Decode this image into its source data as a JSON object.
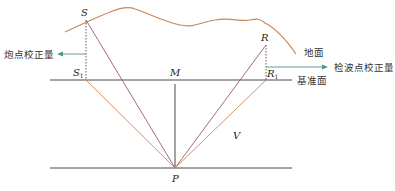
{
  "diagram": {
    "colors": {
      "ground": "#c8875a",
      "ray_direct": "#9a5a6e",
      "ray_reflect": "#c8875a",
      "line": "#333333",
      "arrow": "#4a9a8a"
    },
    "points": {
      "S": "S",
      "S1": "S",
      "S1_sub": "1",
      "M": "M",
      "R": "R",
      "R1": "R",
      "R1_sub": "1",
      "P": "P",
      "V": "V"
    },
    "labels": {
      "shot_correction": "炮点校正量",
      "receiver_correction": "检波点校正量",
      "ground_surface": "地面",
      "datum_plane": "基准面"
    }
  }
}
